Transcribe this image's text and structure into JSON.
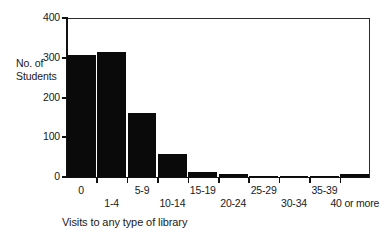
{
  "chart_data": {
    "type": "bar",
    "title": "",
    "subtitle": "",
    "xlabel": "Visits to any type of library",
    "ylabel": "No. of Students",
    "ylabel_line1": "No. of",
    "ylabel_line2": "Students",
    "categories": [
      "0",
      "1-4",
      "5-9",
      "10-14",
      "15-19",
      "20-24",
      "25-29",
      "30-34",
      "35-39",
      "40 or more"
    ],
    "values": [
      308,
      315,
      160,
      58,
      12,
      8,
      3,
      1,
      1,
      8
    ],
    "ylim": [
      0,
      400
    ],
    "yticks": [
      0,
      100,
      200,
      300,
      400
    ],
    "ytick_labels": [
      "0",
      "100",
      "200",
      "300",
      "400"
    ],
    "grid": false,
    "legend": null,
    "bar_color": "#0a0a0a",
    "axis_color": "#111111",
    "background": "#ffffff"
  },
  "axis": {
    "y_title_line1": "No. of",
    "y_title_line2": "Students",
    "x_title": "Visits to any type of library"
  },
  "ticks": {
    "y": [
      {
        "label": "400",
        "value": 400
      },
      {
        "label": "300",
        "value": 300
      },
      {
        "label": "200",
        "value": 200
      },
      {
        "label": "100",
        "value": 100
      },
      {
        "label": "0",
        "value": 0
      }
    ],
    "x": [
      {
        "label": "0",
        "row": "top"
      },
      {
        "label": "1-4",
        "row": "bottom"
      },
      {
        "label": "5-9",
        "row": "top"
      },
      {
        "label": "10-14",
        "row": "bottom"
      },
      {
        "label": "15-19",
        "row": "top"
      },
      {
        "label": "20-24",
        "row": "bottom"
      },
      {
        "label": "25-29",
        "row": "top"
      },
      {
        "label": "30-34",
        "row": "bottom"
      },
      {
        "label": "35-39",
        "row": "top"
      },
      {
        "label": "40 or more",
        "row": "bottom"
      }
    ]
  }
}
